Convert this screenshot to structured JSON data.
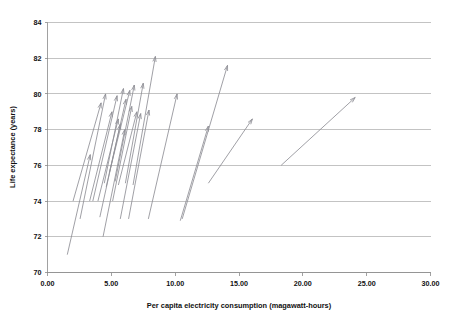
{
  "chart_data": {
    "type": "scatter",
    "subtype": "vector-arrow-plot",
    "title": "",
    "xlabel": "Per capita electricity consumption (magawatt-hours)",
    "ylabel": "Life expectance (years)",
    "xlim": [
      0.0,
      30.0
    ],
    "ylim": [
      70,
      84
    ],
    "xticks": [
      "0.00",
      "5.00",
      "10.00",
      "15.00",
      "20.00",
      "25.00",
      "30.00"
    ],
    "xtick_values": [
      0,
      5,
      10,
      15,
      20,
      25,
      30
    ],
    "yticks": [
      "70",
      "72",
      "74",
      "76",
      "78",
      "80",
      "82",
      "84"
    ],
    "ytick_values": [
      70,
      72,
      74,
      76,
      78,
      80,
      82,
      84
    ],
    "grid": "horizontal",
    "legend": "none",
    "series_color": "#8f8f96",
    "arrow_count": 22,
    "arrows": [
      {
        "id": 1,
        "x0": 1.55,
        "y0": 71.0,
        "x1": 3.35,
        "y1": 76.6
      },
      {
        "id": 2,
        "x0": 2.0,
        "y0": 74.0,
        "x1": 4.2,
        "y1": 79.5
      },
      {
        "id": 3,
        "x0": 2.55,
        "y0": 73.0,
        "x1": 4.55,
        "y1": 80.0
      },
      {
        "id": 4,
        "x0": 3.3,
        "y0": 74.0,
        "x1": 5.05,
        "y1": 79.0
      },
      {
        "id": 5,
        "x0": 3.55,
        "y0": 74.0,
        "x1": 5.45,
        "y1": 79.9
      },
      {
        "id": 6,
        "x0": 3.95,
        "y0": 74.0,
        "x1": 5.55,
        "y1": 78.6
      },
      {
        "id": 7,
        "x0": 4.1,
        "y0": 73.1,
        "x1": 5.7,
        "y1": 78.3
      },
      {
        "id": 8,
        "x0": 4.35,
        "y0": 72.0,
        "x1": 6.05,
        "y1": 78.0
      },
      {
        "id": 9,
        "x0": 4.45,
        "y0": 75.0,
        "x1": 5.95,
        "y1": 80.3
      },
      {
        "id": 10,
        "x0": 4.6,
        "y0": 74.8,
        "x1": 6.15,
        "y1": 79.7
      },
      {
        "id": 11,
        "x0": 4.85,
        "y0": 75.6,
        "x1": 6.45,
        "y1": 80.2
      },
      {
        "id": 12,
        "x0": 5.1,
        "y0": 74.0,
        "x1": 6.6,
        "y1": 79.3
      },
      {
        "id": 13,
        "x0": 5.3,
        "y0": 75.1,
        "x1": 6.8,
        "y1": 80.5
      },
      {
        "id": 14,
        "x0": 5.55,
        "y0": 74.9,
        "x1": 7.0,
        "y1": 79.0
      },
      {
        "id": 15,
        "x0": 5.7,
        "y0": 73.0,
        "x1": 7.3,
        "y1": 78.9
      },
      {
        "id": 16,
        "x0": 6.1,
        "y0": 75.0,
        "x1": 7.5,
        "y1": 80.6
      },
      {
        "id": 17,
        "x0": 6.35,
        "y0": 73.0,
        "x1": 7.95,
        "y1": 79.1
      },
      {
        "id": 18,
        "x0": 6.7,
        "y0": 74.9,
        "x1": 8.45,
        "y1": 82.1
      },
      {
        "id": 19,
        "x0": 7.9,
        "y0": 73.0,
        "x1": 10.15,
        "y1": 80.0
      },
      {
        "id": 20,
        "x0": 10.4,
        "y0": 72.9,
        "x1": 12.6,
        "y1": 78.2
      },
      {
        "id": 21,
        "x0": 10.55,
        "y0": 73.0,
        "x1": 14.1,
        "y1": 81.6
      },
      {
        "id": 22,
        "x0": 12.6,
        "y0": 75.0,
        "x1": 16.05,
        "y1": 78.6
      },
      {
        "id": 23,
        "x0": 18.3,
        "y0": 76.0,
        "x1": 24.1,
        "y1": 79.8
      }
    ]
  },
  "axes": {
    "x_title": "Per capita electricity consumption (magawatt-hours)",
    "y_title": "Life expectance (years)"
  }
}
